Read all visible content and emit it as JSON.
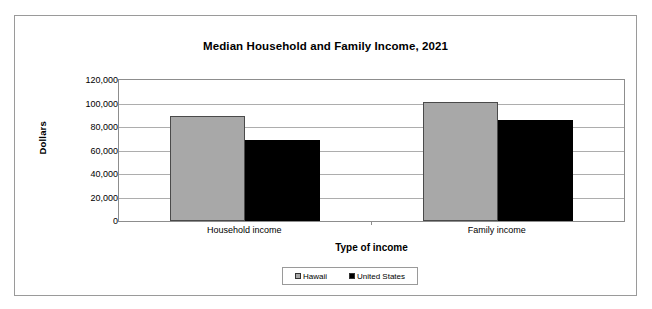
{
  "chart_data": {
    "type": "bar",
    "title": "Median Household and Family Income, 2021",
    "xlabel": "Type of income",
    "ylabel": "Dollars",
    "categories": [
      "Household income",
      "Family income"
    ],
    "series": [
      {
        "name": "Hawaii",
        "color": "#a8a8a8",
        "values": [
          89000,
          101000
        ]
      },
      {
        "name": "United States",
        "color": "#000000",
        "values": [
          69000,
          86000
        ]
      }
    ],
    "ylim": [
      0,
      120000
    ],
    "ytick_values": [
      0,
      20000,
      40000,
      60000,
      80000,
      100000,
      120000
    ],
    "ytick_labels": [
      "0",
      "20,000",
      "40,000",
      "60,000",
      "80,000",
      "100,000",
      "120,000"
    ],
    "grid": true,
    "legend_position": "bottom"
  },
  "legend": {
    "items": [
      {
        "label": "Hawaii"
      },
      {
        "label": "United States"
      }
    ]
  }
}
